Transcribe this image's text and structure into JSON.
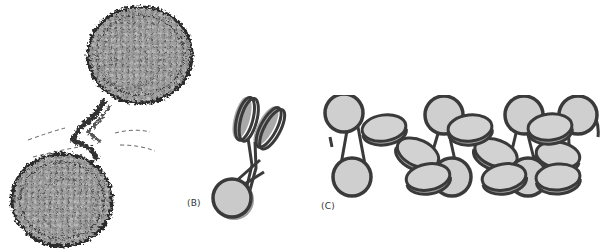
{
  "figure": {
    "panels": [
      {
        "id": "A",
        "label": "",
        "description": "Molecular surface/ribbon rendering of two nucleosome cores connected by linker DNA, with dashed outline curves",
        "colors": {
          "protein_fill": "#a9a9a9",
          "backbone": "#2b2b2b",
          "dashed_line": "#555555"
        }
      },
      {
        "id": "B",
        "label": "(B)",
        "description": "Schematic of a nucleosome (gray disc wrapped in dark DNA) with two tilted nucleosomes stacked above",
        "colors": {
          "disc_fill": "#c8c8c8",
          "disc_shadow": "#a0a0a0",
          "dna": "#3a3a3a"
        }
      },
      {
        "id": "C",
        "label": "(C)",
        "description": "Schematic chromatin fiber: row of nucleosome discs connected by linker DNA in a zig-zag arrangement",
        "colors": {
          "disc_fill": "#cfcfcf",
          "disc_shadow": "#a5a5a5",
          "dna": "#3a3a3a"
        }
      }
    ]
  }
}
